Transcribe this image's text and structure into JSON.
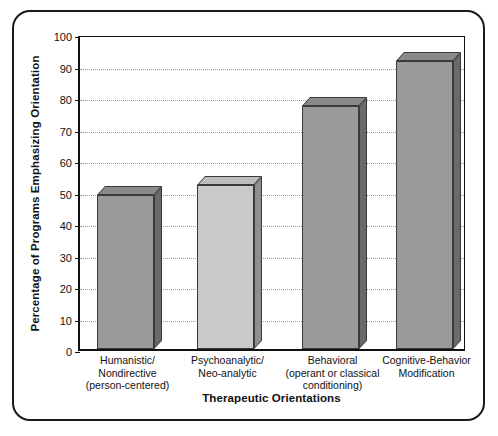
{
  "chart_data": {
    "type": "bar",
    "title": "",
    "xlabel": "Therapeutic Orientations",
    "ylabel": "Percentage of Programs Emphasizing Orientation",
    "categories": [
      "Humanistic/ Nondirective (person-centered)",
      "Psychoanalytic/ Neo-analytic",
      "Behavioral (operant or classical conditioning)",
      "Cognitive-Behavior Modification"
    ],
    "category_lines": [
      [
        "Humanistic/",
        "Nondirective",
        "(person-centered)"
      ],
      [
        "Psychoanalytic/",
        "Neo-analytic"
      ],
      [
        "Behavioral",
        "(operant or classical",
        "conditioning)"
      ],
      [
        "Cognitive-Behavior",
        "Modification"
      ]
    ],
    "values": [
      49,
      52,
      77,
      91.5
    ],
    "ylim": [
      0,
      100
    ],
    "yticks": [
      0,
      10,
      20,
      30,
      40,
      50,
      60,
      70,
      80,
      90,
      100
    ],
    "ytick_labels": [
      "0",
      "10",
      "20",
      "30",
      "40",
      "50",
      "60",
      "70",
      "80",
      "90",
      "100"
    ],
    "grid": true,
    "legend": "none",
    "bar_colors": [
      "#9a9a9a",
      "#c9c9c9",
      "#9a9a9a",
      "#9a9a9a"
    ],
    "bar_top_colors": [
      "#8a8a8a",
      "#bdbdbd",
      "#8a8a8a",
      "#8a8a8a"
    ],
    "bar_side_colors": [
      "#6a6a6a",
      "#8f8f8f",
      "#6a6a6a",
      "#6a6a6a"
    ],
    "style": {
      "frame_color": "#1a1a1a",
      "axis_color": "#111111",
      "gridline_color": "#9b9b9b",
      "background": "#ffffff"
    }
  }
}
